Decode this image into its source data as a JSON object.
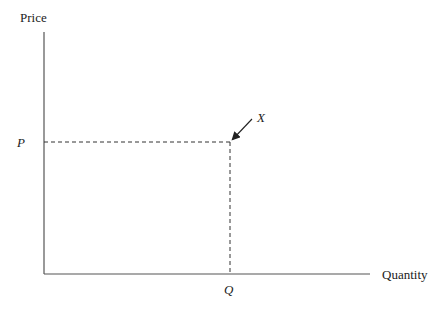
{
  "diagram": {
    "type": "supply-demand-axes",
    "y_axis_label": "Price",
    "x_axis_label": "Quantity",
    "price_label": "P",
    "quantity_label": "Q",
    "point_label": "X",
    "origin": [
      44,
      274
    ],
    "y_axis_top": 32,
    "x_axis_right": 370,
    "point": [
      230,
      142
    ],
    "arrow": {
      "from": [
        252,
        119
      ],
      "to": [
        232,
        140
      ]
    },
    "colors": {
      "axis": "#555555",
      "dashed": "#333333",
      "text": "#222222"
    }
  }
}
